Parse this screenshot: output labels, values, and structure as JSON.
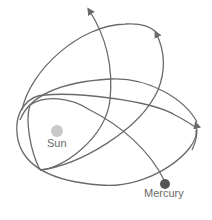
{
  "diagram": {
    "title": "",
    "bodies": [
      {
        "name": "sun",
        "label": "Sun",
        "color": "#c8c8c8"
      },
      {
        "name": "mercury",
        "label": "Mercury",
        "color": "#555555"
      }
    ],
    "orbit_color": "#6a6a6a",
    "text_color": "#6a6a6a"
  }
}
